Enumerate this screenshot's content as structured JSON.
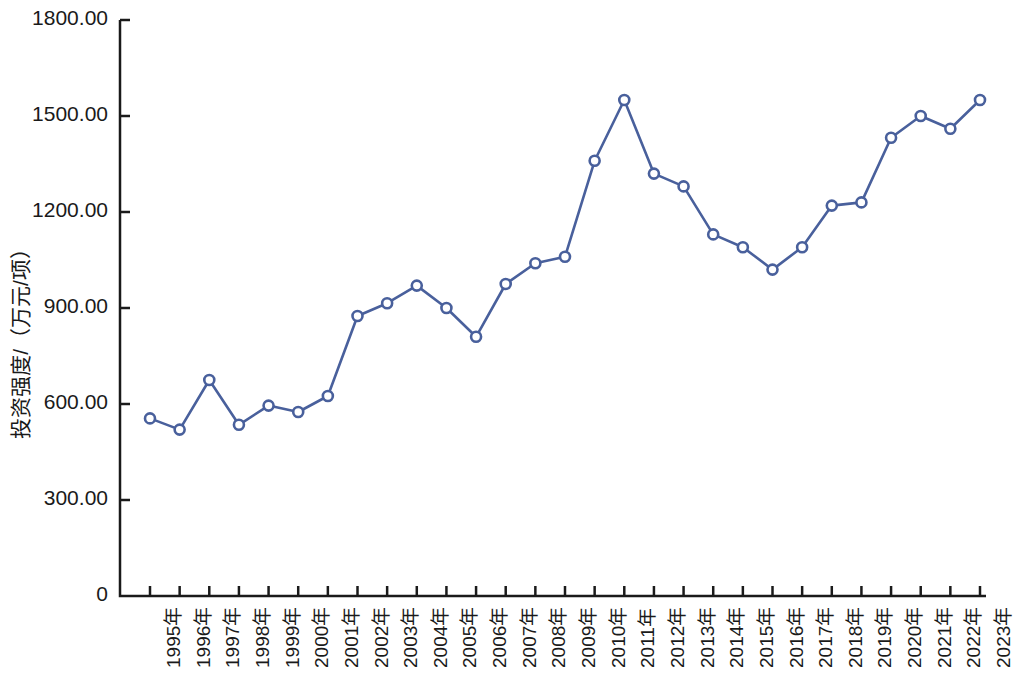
{
  "chart_data": {
    "type": "line",
    "title": "",
    "xlabel": "",
    "ylabel": "投资强度/（万元/项）",
    "categories": [
      "1995年",
      "1996年",
      "1997年",
      "1998年",
      "1999年",
      "2000年",
      "2001年",
      "2002年",
      "2003年",
      "2004年",
      "2005年",
      "2006年",
      "2007年",
      "2008年",
      "2009年",
      "2010年",
      "2011年",
      "2012年",
      "2013年",
      "2014年",
      "2015年",
      "2016年",
      "2017年",
      "2018年",
      "2019年",
      "2020年",
      "2021年",
      "2022年",
      "2023年"
    ],
    "values": [
      555,
      520,
      675,
      535,
      595,
      575,
      625,
      875,
      915,
      970,
      900,
      810,
      975,
      1040,
      1060,
      1360,
      1550,
      1320,
      1280,
      1130,
      1090,
      1020,
      1090,
      1220,
      1230,
      1432,
      1500,
      1460,
      1550
    ],
    "series": [
      {
        "name": "投资强度",
        "values": [
          555,
          520,
          675,
          535,
          595,
          575,
          625,
          875,
          915,
          970,
          900,
          810,
          975,
          1040,
          1060,
          1360,
          1550,
          1320,
          1280,
          1130,
          1090,
          1020,
          1090,
          1220,
          1230,
          1432,
          1500,
          1460,
          1550
        ]
      }
    ],
    "ylim": [
      0,
      1800
    ],
    "y_ticks": [
      0,
      300,
      600,
      900,
      1200,
      1500,
      1800
    ],
    "y_tick_labels": [
      "0",
      "300.00",
      "600.00",
      "900.00",
      "1200.00",
      "1500.00",
      "1800.00"
    ],
    "grid": false,
    "legend": "none",
    "line_color": "#49609c",
    "marker": "circle-open",
    "marker_fill": "#ffffff",
    "axis_color": "#1a1a1a"
  }
}
